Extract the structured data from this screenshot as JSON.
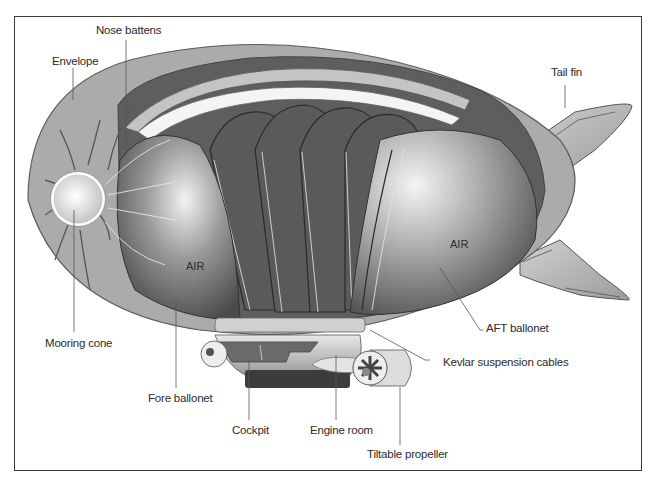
{
  "diagram": {
    "labels": {
      "nose_battens": "Nose battens",
      "envelope": "Envelope",
      "tail_fin": "Tail fin",
      "mooring_cone": "Mooring cone",
      "fore_ballonet": "Fore ballonet",
      "cockpit": "Cockpit",
      "engine_room": "Engine room",
      "tiltable_propeller": "Tiltable propeller",
      "kevlar_cables": "Kevlar suspension cables",
      "aft_ballonet": "AFT ballonet"
    },
    "interior_text": {
      "fore_air": "AIR",
      "aft_air": "AIR"
    },
    "colors": {
      "envelope": "#a8a8a8",
      "ballonet_dark": "#5a5a5a",
      "ballonet_light": "#c8c8c8",
      "frame": "#3a3a3a",
      "text": "#2b2b2b"
    }
  }
}
